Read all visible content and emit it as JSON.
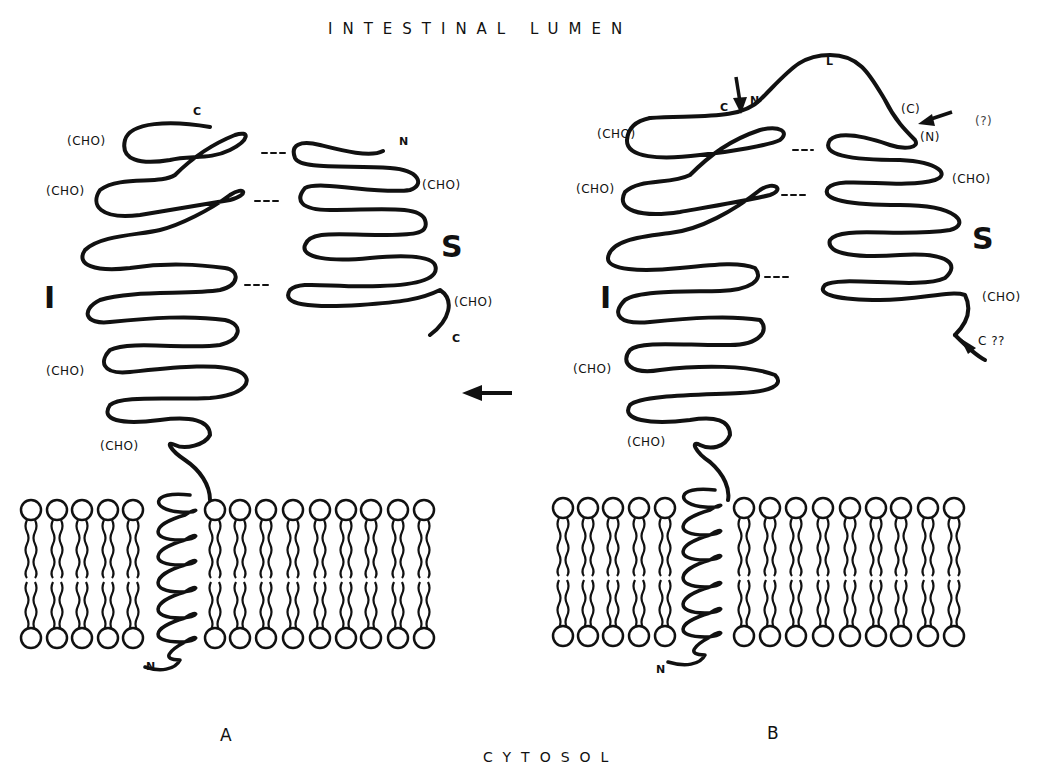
{
  "header": {
    "top_label": "INTESTINAL LUMEN",
    "bottom_label": "CYTOSOL"
  },
  "colors": {
    "ink": "#111111",
    "background": "#ffffff"
  },
  "panels": [
    {
      "id": "A",
      "label": "A",
      "subunit_I": {
        "label": "I",
        "carbohydrate_labels": [
          "(CHO)",
          "(CHO)",
          "(CHO)",
          "(CHO)"
        ],
        "c_terminus": "C",
        "n_terminus": "N"
      },
      "subunit_S": {
        "label": "S",
        "carbohydrate_labels": [
          "(CHO)",
          "(CHO)"
        ],
        "n_terminus": "N",
        "c_terminus": "C"
      },
      "arrow": "left-arrow"
    },
    {
      "id": "B",
      "label": "B",
      "linker": {
        "label": "L"
      },
      "subunit_I": {
        "label": "I",
        "carbohydrate_labels": [
          "(CHO)",
          "(CHO)",
          "(CHO)",
          "(CHO)"
        ],
        "c_terminus": "C",
        "n_terminus": "N"
      },
      "subunit_S": {
        "label": "S",
        "carbohydrate_labels": [
          "(CHO)",
          "(CHO)"
        ],
        "n_terminus": "(N)",
        "c_terminus": "C ??"
      },
      "linker_ends": {
        "n_label": "N",
        "c_label": "(C)",
        "question": "(?)"
      }
    }
  ]
}
